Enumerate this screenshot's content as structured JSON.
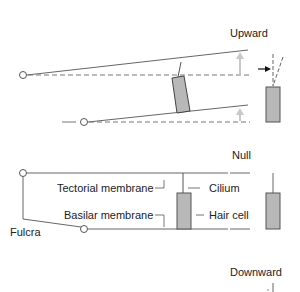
{
  "diagram": {
    "panels": {
      "upward": {
        "title": "Upward"
      },
      "null": {
        "title": "Null"
      },
      "downward": {
        "title": "Downward"
      }
    },
    "labels": {
      "tectorial_membrane": "Tectorial membrane",
      "basilar_membrane": "Basilar membrane",
      "cilium": "Cilium",
      "hair_cell": "Hair cell",
      "fulcra": "Fulcra"
    },
    "colors": {
      "line": "#555555",
      "hair_cell_fill": "#b8b8b8",
      "arrow_gray": "#c8c8c8",
      "arrow_black": "#111111"
    }
  }
}
